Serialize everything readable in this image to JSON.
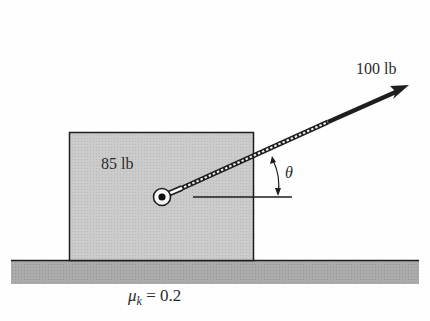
{
  "block": {
    "weight_label": "85 lb"
  },
  "force": {
    "magnitude_label": "100 lb"
  },
  "angle": {
    "symbol": "θ"
  },
  "ground": {
    "friction_label_symbol": "μ",
    "friction_label_sub": "k",
    "friction_label_value": "= 0.2"
  },
  "colors": {
    "block_fill": "#c9c9c9",
    "ground_fill": "#a9a9a9",
    "stroke": "#1e1e1e"
  }
}
